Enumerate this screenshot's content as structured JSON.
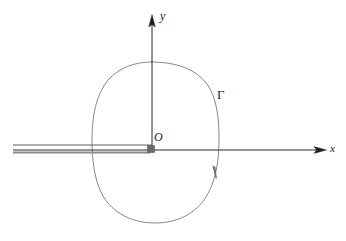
{
  "figure": {
    "type": "math-diagram",
    "width": 346,
    "height": 241,
    "background_color": "#ffffff"
  },
  "axes": {
    "x_axis": {
      "label": "x",
      "color": "#2b2b2b",
      "start_x": 13,
      "end_x": 326,
      "y": 150,
      "arrow": "right"
    },
    "y_axis": {
      "label": "y",
      "color": "#2b2b2b",
      "x": 152,
      "start_y": 150,
      "end_y": 16,
      "arrow": "up"
    },
    "origin": {
      "label": "O",
      "x": 152,
      "y": 150,
      "marker": "filled-square",
      "marker_color": "#6b6b6b",
      "marker_size": 6
    }
  },
  "contour": {
    "label": "Γ",
    "color": "#7a7a7a",
    "stroke_width": 0.9,
    "direction_arrow": {
      "x": 215,
      "y": 172,
      "orientation": "downward-along-curve"
    },
    "extents": {
      "top_y": 62,
      "bottom_y": 223,
      "left_x": 92,
      "right_x": 219
    }
  },
  "branch_cut": {
    "name": "branch-cut-slit",
    "upper_line": {
      "x_start": 13,
      "x_end": 152,
      "y": 145,
      "color": "#4d4d4d",
      "width": 0.9
    },
    "lower_line": {
      "x_start": 13,
      "x_end": 152,
      "y": 152,
      "color": "#8c8c8c",
      "width": 2.2
    }
  }
}
